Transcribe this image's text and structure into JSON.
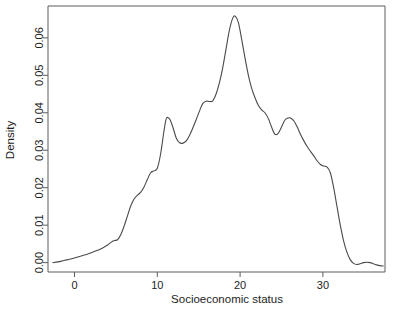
{
  "chart_data": {
    "type": "line",
    "title": "",
    "subtitle": "",
    "xlabel": "Socioeconomic status",
    "ylabel": "Density",
    "xlim": [
      -3.2,
      37.5
    ],
    "ylim": [
      -0.0025,
      0.0685
    ],
    "xticks": [
      0,
      10,
      20,
      30
    ],
    "xtick_labels": [
      "0",
      "10",
      "20",
      "30"
    ],
    "yticks": [
      0.0,
      0.01,
      0.02,
      0.03,
      0.04,
      0.05,
      0.06
    ],
    "ytick_labels": [
      "0.00",
      "0.01",
      "0.02",
      "0.03",
      "0.04",
      "0.05",
      "0.06"
    ],
    "grid": false,
    "legend": null,
    "annotations": [],
    "series": [
      {
        "name": "Density",
        "color": "#4a4a4a",
        "x": [
          -2.6,
          -2.0,
          -1.4,
          -0.8,
          -0.2,
          0.4,
          1.0,
          1.6,
          2.2,
          2.8,
          3.4,
          4.0,
          4.4,
          4.8,
          5.2,
          5.6,
          6.0,
          6.4,
          6.8,
          7.2,
          7.6,
          8.0,
          8.4,
          8.8,
          9.2,
          9.6,
          10.0,
          10.4,
          10.8,
          11.1,
          11.5,
          11.9,
          12.3,
          12.7,
          13.1,
          13.5,
          13.9,
          14.3,
          14.7,
          15.1,
          15.5,
          15.9,
          16.3,
          16.7,
          17.1,
          17.5,
          17.9,
          18.3,
          18.7,
          19.1,
          19.4,
          19.8,
          20.2,
          20.6,
          21.0,
          21.4,
          21.8,
          22.2,
          22.6,
          23.0,
          23.4,
          23.8,
          24.2,
          24.6,
          25.0,
          25.4,
          25.8,
          26.1,
          26.5,
          26.9,
          27.3,
          27.7,
          28.1,
          28.5,
          28.9,
          29.3,
          29.7,
          30.1,
          30.5,
          30.9,
          31.3,
          31.7,
          32.1,
          32.5,
          32.9,
          33.3,
          33.7,
          34.1,
          34.5,
          34.9,
          35.3,
          35.7,
          36.1,
          36.5,
          36.9,
          37.3
        ],
        "y": [
          0.0,
          0.0002,
          0.0005,
          0.0008,
          0.0011,
          0.0015,
          0.0019,
          0.0023,
          0.0028,
          0.0033,
          0.0039,
          0.0047,
          0.0054,
          0.0059,
          0.0061,
          0.0075,
          0.0098,
          0.0125,
          0.0152,
          0.017,
          0.018,
          0.0188,
          0.0202,
          0.0222,
          0.024,
          0.0245,
          0.0252,
          0.029,
          0.035,
          0.0385,
          0.0383,
          0.036,
          0.0332,
          0.032,
          0.0319,
          0.0325,
          0.034,
          0.036,
          0.0382,
          0.0405,
          0.0425,
          0.0431,
          0.043,
          0.0432,
          0.045,
          0.048,
          0.052,
          0.057,
          0.062,
          0.0652,
          0.0658,
          0.064,
          0.0595,
          0.0545,
          0.05,
          0.0465,
          0.044,
          0.042,
          0.0408,
          0.04,
          0.0385,
          0.0362,
          0.0343,
          0.0345,
          0.0362,
          0.038,
          0.0386,
          0.0386,
          0.0378,
          0.0362,
          0.0342,
          0.0325,
          0.031,
          0.0297,
          0.0285,
          0.0272,
          0.0262,
          0.0258,
          0.0255,
          0.024,
          0.02,
          0.015,
          0.01,
          0.0058,
          0.0028,
          0.0008,
          -0.0002,
          -0.0005,
          -0.0003,
          0.0,
          0.0001,
          0.0,
          -0.0003,
          -0.0006,
          -0.0008,
          -0.0009
        ]
      }
    ]
  },
  "axis": {
    "x_title": "Socioeconomic status",
    "y_title": "Density",
    "x_tick_labels": [
      "0",
      "10",
      "20",
      "30"
    ],
    "y_tick_labels": [
      "0.00",
      "0.01",
      "0.02",
      "0.03",
      "0.04",
      "0.05",
      "0.06"
    ]
  },
  "style": {
    "background": "#ffffff",
    "curve_color": "#4a4a4a",
    "frame_color": "#5d5d5d",
    "text_color": "#1d1d1d"
  }
}
